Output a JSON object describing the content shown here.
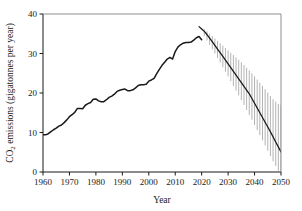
{
  "chart_data": {
    "type": "line",
    "title": "",
    "xlabel": "Year",
    "ylabel": "CO2 emissions (gigatonnes per year)",
    "ylabel_parts": {
      "pre": "CO",
      "sub": "2",
      "post": " emissions (gigatonnes per year)"
    },
    "xlim": [
      1960,
      2050
    ],
    "ylim": [
      0,
      40
    ],
    "xticks": [
      1960,
      1970,
      1980,
      1990,
      2000,
      2010,
      2020,
      2030,
      2040,
      2050
    ],
    "yticks": [
      0,
      10,
      20,
      30,
      40
    ],
    "grid": false,
    "legend": null,
    "line_color": "#1a1a1a",
    "band_color": "#8a8a8a",
    "series": [
      {
        "name": "Historical CO2 emissions",
        "style": "solid-line",
        "x": [
          1960,
          1961,
          1962,
          1963,
          1964,
          1965,
          1966,
          1967,
          1968,
          1969,
          1970,
          1971,
          1972,
          1973,
          1974,
          1975,
          1976,
          1977,
          1978,
          1979,
          1980,
          1981,
          1982,
          1983,
          1984,
          1985,
          1986,
          1987,
          1988,
          1989,
          1990,
          1991,
          1992,
          1993,
          1994,
          1995,
          1996,
          1997,
          1998,
          1999,
          2000,
          2001,
          2002,
          2003,
          2004,
          2005,
          2006,
          2007,
          2008,
          2009,
          2010,
          2011,
          2012,
          2013,
          2014,
          2015,
          2016,
          2017,
          2018,
          2019,
          2020
        ],
        "values": [
          9.4,
          9.4,
          9.7,
          10.2,
          10.7,
          11.1,
          11.6,
          11.9,
          12.5,
          13.2,
          14.0,
          14.5,
          15.1,
          16.1,
          16.1,
          16.0,
          16.9,
          17.3,
          17.6,
          18.4,
          18.5,
          18.0,
          17.8,
          17.8,
          18.3,
          18.9,
          19.2,
          19.7,
          20.4,
          20.7,
          20.9,
          21.0,
          20.6,
          20.6,
          20.8,
          21.3,
          21.9,
          22.1,
          22.1,
          22.2,
          23.0,
          23.3,
          23.7,
          24.9,
          26.0,
          27.0,
          27.8,
          28.6,
          29.0,
          28.6,
          30.5,
          31.6,
          32.2,
          32.6,
          32.8,
          32.8,
          32.9,
          33.4,
          34.0,
          34.3,
          33.5
        ]
      },
      {
        "name": "Projected emissions pathway (central)",
        "style": "solid-line",
        "x": [
          2019,
          2020,
          2021,
          2022,
          2024,
          2026,
          2028,
          2030,
          2032,
          2034,
          2036,
          2038,
          2040,
          2042,
          2044,
          2046,
          2048,
          2050
        ],
        "values": [
          36.8,
          36.2,
          35.6,
          34.8,
          33.0,
          31.1,
          29.3,
          27.4,
          25.5,
          23.6,
          21.7,
          19.8,
          17.4,
          15.0,
          12.6,
          10.2,
          7.6,
          5.1
        ]
      }
    ],
    "uncertainty_band": {
      "name": "Projection uncertainty range",
      "style": "vertical-hatch",
      "x": [
        2021,
        2023,
        2025,
        2027,
        2029,
        2031,
        2033,
        2035,
        2037,
        2039,
        2041,
        2043,
        2045,
        2047,
        2049,
        2050
      ],
      "upper": [
        36.2,
        35.0,
        33.8,
        32.6,
        31.4,
        30.2,
        29.0,
        27.8,
        26.4,
        25.0,
        23.4,
        21.8,
        20.1,
        18.4,
        17.2,
        17.0
      ],
      "lower": [
        34.4,
        32.2,
        30.0,
        27.7,
        25.4,
        23.0,
        20.6,
        18.2,
        15.7,
        13.2,
        10.6,
        8.0,
        5.4,
        2.7,
        0.3,
        0.0
      ]
    }
  },
  "axis": {
    "x_tick_labels": [
      "1960",
      "1970",
      "1980",
      "1990",
      "2000",
      "2010",
      "2020",
      "2030",
      "2040",
      "2050"
    ],
    "y_tick_labels": [
      "0",
      "10",
      "20",
      "30",
      "40"
    ],
    "x_title": "Year",
    "y_title_pre": "CO",
    "y_title_sub": "2",
    "y_title_post": " emissions (gigatonnes per year)"
  }
}
